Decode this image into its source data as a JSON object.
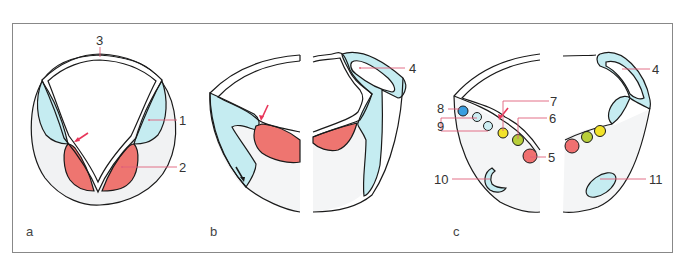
{
  "figure": {
    "panels": [
      {
        "id": "a",
        "label": "a",
        "callouts": [
          {
            "num": "1",
            "structure": "blue region (upper lateral)"
          },
          {
            "num": "2",
            "structure": "red region (lower lateral)"
          },
          {
            "num": "3",
            "structure": "roof plate / top wall"
          }
        ]
      },
      {
        "id": "b",
        "label": "b",
        "callouts": [
          {
            "num": "4",
            "structure": "blue folded region (dorsal)"
          }
        ]
      },
      {
        "id": "c",
        "label": "c",
        "callouts": [
          {
            "num": "4",
            "structure": "blue folded region (dorsal)"
          },
          {
            "num": "5",
            "structure": "red circles"
          },
          {
            "num": "6",
            "structure": "green circles"
          },
          {
            "num": "7",
            "structure": "yellow circles"
          },
          {
            "num": "8",
            "structure": "dark blue circle"
          },
          {
            "num": "9",
            "structure": "light blue circles"
          },
          {
            "num": "10",
            "structure": "C-shaped blue structure"
          },
          {
            "num": "11",
            "structure": "oval blue structure"
          }
        ]
      }
    ],
    "colors": {
      "blue_fill": "#c5ecf1",
      "red_fill": "#ee7570",
      "grey_fill": "#f1f2f3",
      "leader_line": "#e0607a",
      "arrow_red": "#e8365a",
      "dark_blue_circle": "#3a9ee0",
      "light_blue_circle": "#cdeef3",
      "yellow_circle": "#f2e22a",
      "green_circle": "#b8cf3a",
      "red_circle": "#f07070",
      "outline": "#1a1a1a",
      "frame": "#888888"
    }
  }
}
